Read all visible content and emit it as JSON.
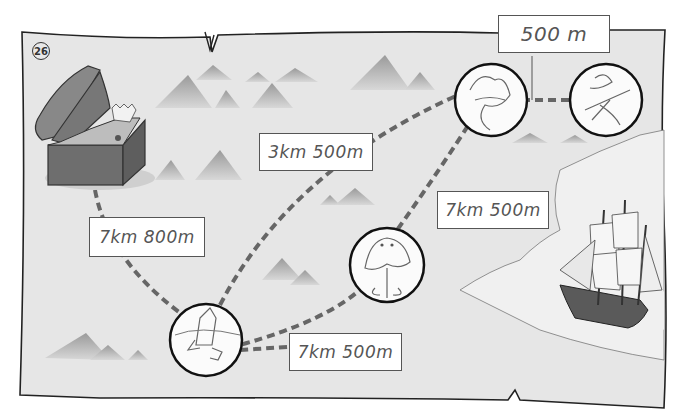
{
  "worksheet": {
    "problem_number": "26",
    "title": "Treasure map route distances"
  },
  "map": {
    "background_color": "#e6e6e6",
    "border_color": "#222222",
    "route_color": "#666666",
    "locations": [
      {
        "id": "treasure-chest",
        "label": "treasure chest"
      },
      {
        "id": "rocket-circle",
        "label": "drawn rocket"
      },
      {
        "id": "jellyfish-circle",
        "label": "drawn jellyfish"
      },
      {
        "id": "scribble-circle-1",
        "label": "drawn scribble"
      },
      {
        "id": "scribble-circle-2",
        "label": "drawn scribble"
      },
      {
        "id": "ship",
        "label": "sailing ship"
      }
    ]
  },
  "labels": {
    "chest_to_rocket": "7km 800m",
    "rocket_to_top": "3km 500m",
    "rocket_to_bottom": "7km 500m",
    "jellyfish_to_top": "7km 500m",
    "top_circles": "500 m"
  }
}
